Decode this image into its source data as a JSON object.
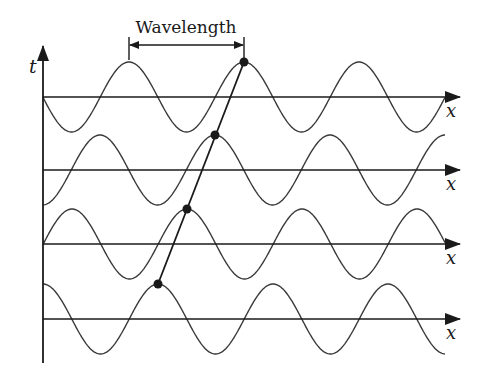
{
  "diagram": {
    "title_label": "Wavelength",
    "vertical_axis_label": "t",
    "horizontal_axis_label": "x",
    "colors": {
      "ink": "#1a1a1a",
      "wave": "#3a3a3a",
      "background": "#ffffff"
    },
    "geometry": {
      "origin_x": 43,
      "axis_end_x": 460,
      "wave_end_x": 445,
      "vertical_axis_top": 46,
      "vertical_axis_bottom": 363,
      "wavelength_px": 115,
      "amplitude_px": 35
    },
    "wavelength_bracket": {
      "x1": 129,
      "x2": 244,
      "y": 45,
      "tick_top": 37,
      "tick_bottom": 60
    },
    "waves": [
      {
        "axis_y": 97,
        "peak_x": 244,
        "label": "x"
      },
      {
        "axis_y": 170,
        "peak_x": 215,
        "label": "x"
      },
      {
        "axis_y": 244,
        "peak_x": 187,
        "label": "x"
      },
      {
        "axis_y": 319,
        "peak_x": 158,
        "label": "x"
      }
    ],
    "tracked_points": [
      {
        "x": 244,
        "y": 62
      },
      {
        "x": 215,
        "y": 135
      },
      {
        "x": 187,
        "y": 209
      },
      {
        "x": 158,
        "y": 284
      }
    ]
  }
}
